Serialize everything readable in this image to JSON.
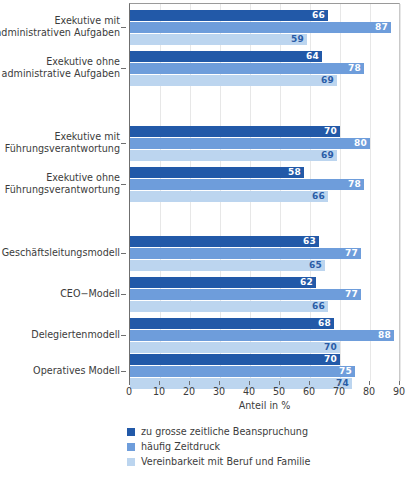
{
  "chart_data": {
    "type": "bar",
    "orientation": "horizontal",
    "title": "",
    "xlabel": "Anteil in %",
    "ylabel": "",
    "xlim": [
      0,
      90
    ],
    "xticks": [
      0,
      10,
      20,
      30,
      40,
      50,
      60,
      70,
      80,
      90
    ],
    "grid": "vertical",
    "legend_position": "bottom-left",
    "categories": [
      "Exekutive mit administrativen Aufgaben",
      "Exekutive ohne administrative Aufgaben",
      "Exekutive mit Führungsverantwortung",
      "Exekutive ohne Führungsverantwortung",
      "Geschäftsleitungsmodell",
      "CEO−Modell",
      "Delegiertenmodell",
      "Operatives Modell"
    ],
    "category_lines": [
      [
        "Exekutive mit",
        "administrativen Aufgaben"
      ],
      [
        "Exekutive ohne",
        "administrative Aufgaben"
      ],
      [
        "Exekutive mit",
        "Führungsverantwortung"
      ],
      [
        "Exekutive ohne",
        "Führungsverantwortung"
      ],
      [
        "Geschäftsleitungsmodell"
      ],
      [
        "CEO−Modell"
      ],
      [
        "Delegiertenmodell"
      ],
      [
        "Operatives Modell"
      ]
    ],
    "series": [
      {
        "name": "zu grosse zeitliche Beanspruchung",
        "color": "#2259a8",
        "values": [
          66,
          64,
          70,
          58,
          63,
          62,
          68,
          70
        ]
      },
      {
        "name": "häufig Zeitdruck",
        "color": "#6e9ddb",
        "values": [
          87,
          78,
          80,
          78,
          77,
          77,
          88,
          75
        ]
      },
      {
        "name": "Vereinbarkeit mit Beruf und Familie",
        "color": "#bcd5ef",
        "values": [
          59,
          69,
          69,
          66,
          65,
          66,
          70,
          74
        ]
      }
    ]
  },
  "colors": {
    "series_dark": "#2259a8",
    "series_mid": "#6e9ddb",
    "series_light": "#bcd5ef",
    "axis": "#6f6f6f",
    "gridline": "#e7e7e7",
    "text": "#3c3c3c",
    "background": "#ffffff"
  }
}
